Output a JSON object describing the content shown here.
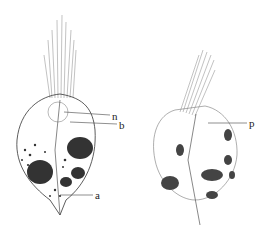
{
  "figure": {
    "left_cell": {
      "labels": [
        {
          "id": "n",
          "text": "n",
          "x": 112,
          "y": 111
        },
        {
          "id": "b",
          "text": "b",
          "x": 119,
          "y": 121
        },
        {
          "id": "a",
          "text": "a",
          "x": 95,
          "y": 191
        }
      ]
    },
    "right_cell": {
      "labels": [
        {
          "id": "p",
          "text": "p",
          "x": 249,
          "y": 119
        }
      ]
    },
    "colors": {
      "ink": "#222222",
      "shade": "#555555",
      "background": "#ffffff"
    }
  }
}
